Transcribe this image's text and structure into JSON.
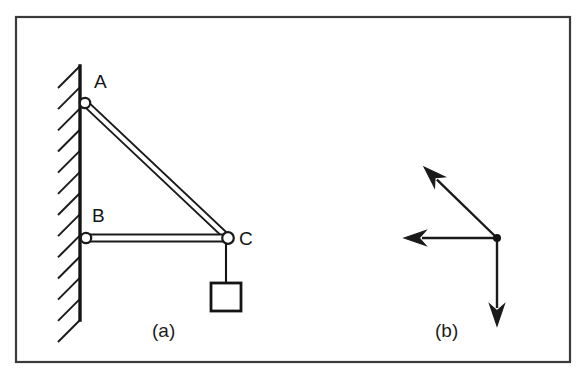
{
  "figure": {
    "kind": "engineering-statics-figure",
    "background_color": "#ffffff",
    "ink_color": "#1a1a1a",
    "frame": {
      "stroke": "#3a3a3a",
      "x": 16,
      "y": 17,
      "width": 554,
      "height": 345
    },
    "captions": [
      {
        "name": "caption-a",
        "label": "(a)",
        "x": 152,
        "y": 337
      },
      {
        "name": "caption-b",
        "label": "(b)",
        "x": 435,
        "y": 337
      }
    ],
    "panel_a": {
      "name": "bracket-assembly",
      "wall": {
        "name": "support-wall",
        "line_x": 80,
        "top_y": 66,
        "bottom_y": 320,
        "hatch_count": 13,
        "hatch_length": 22,
        "hatch_direction": "up-right-45deg"
      },
      "joints": [
        {
          "id": "A",
          "label": "A",
          "x": 85,
          "y": 103,
          "radius": 5.2,
          "label_x": 94,
          "label_y": 88
        },
        {
          "id": "B",
          "label": "B",
          "x": 86,
          "y": 238,
          "radius": 5.2,
          "label_x": 92,
          "label_y": 222
        },
        {
          "id": "C",
          "label": "C",
          "x": 228,
          "y": 238,
          "radius": 5.8,
          "label_x": 239,
          "label_y": 245
        }
      ],
      "members": [
        {
          "id": "AC",
          "name": "diagonal-tie-member-ac",
          "from": "A",
          "to": "C",
          "style": "double-line-bar",
          "thickness": 6
        },
        {
          "id": "BC",
          "name": "horizontal-strut-member-bc",
          "from": "B",
          "to": "C",
          "style": "double-line-bar",
          "thickness": 7
        }
      ],
      "load": {
        "name": "hanging-block",
        "cable": {
          "from_x": 226,
          "from_y": 243,
          "to_x": 226,
          "to_y": 284
        },
        "block": {
          "x": 211,
          "y": 283,
          "width": 30,
          "height": 28
        }
      }
    },
    "panel_b": {
      "name": "force-vector-diagram",
      "origin": {
        "x": 497,
        "y": 238,
        "dot_radius": 4
      },
      "vectors": [
        {
          "id": "v-diagonal",
          "name": "vector-up-left-diagonal",
          "tip_x": 424,
          "tip_y": 167,
          "direction": "up-left",
          "angle_deg": 135,
          "length_px": 102
        },
        {
          "id": "v-horizontal",
          "name": "vector-left-horizontal",
          "tip_x": 404,
          "tip_y": 238,
          "direction": "left",
          "angle_deg": 180,
          "length_px": 93
        },
        {
          "id": "v-vertical",
          "name": "vector-down-vertical",
          "tip_x": 497,
          "tip_y": 326,
          "direction": "down",
          "angle_deg": 270,
          "length_px": 88
        }
      ],
      "arrowhead": {
        "length": 22,
        "half_width": 7.5
      }
    }
  }
}
